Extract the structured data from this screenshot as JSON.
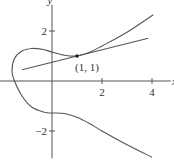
{
  "chart_data": {
    "type": "line",
    "title": "",
    "xlabel": "x",
    "ylabel": "y",
    "xlim": [
      -2.1,
      4.8
    ],
    "ylim": [
      -3.1,
      3.2
    ],
    "x_ticks": [
      {
        "value": 2,
        "label": "2"
      },
      {
        "value": 4,
        "label": "4"
      }
    ],
    "y_ticks": [
      {
        "value": 2,
        "label": "2"
      },
      {
        "value": -2,
        "label": "−2"
      }
    ],
    "grid": false,
    "series": [
      {
        "name": "curve",
        "points": [
          [
            4.05,
            2.65
          ],
          [
            3.0,
            1.95
          ],
          [
            2.0,
            1.4
          ],
          [
            1.5,
            1.15
          ],
          [
            1.0,
            1.0
          ],
          [
            0.5,
            1.03
          ],
          [
            0.0,
            1.16
          ],
          [
            -0.4,
            1.27
          ],
          [
            -0.8,
            1.3
          ],
          [
            -1.2,
            1.2
          ],
          [
            -1.5,
            0.9
          ],
          [
            -1.6,
            0.4
          ],
          [
            -1.5,
            0.0
          ],
          [
            -1.2,
            -0.6
          ],
          [
            -0.8,
            -1.05
          ],
          [
            -0.3,
            -1.25
          ],
          [
            0.0,
            -1.28
          ],
          [
            0.5,
            -1.3
          ],
          [
            1.0,
            -1.45
          ],
          [
            1.5,
            -1.7
          ],
          [
            2.0,
            -2.0
          ],
          [
            3.0,
            -2.55
          ],
          [
            4.0,
            -3.05
          ]
        ]
      },
      {
        "name": "tangent-line",
        "points": [
          [
            -1.2,
            0.45
          ],
          [
            3.85,
            1.71
          ]
        ]
      }
    ],
    "annotations": [
      {
        "text": "(1, 1)",
        "x": 1,
        "y": 1,
        "marker": "point"
      }
    ]
  }
}
